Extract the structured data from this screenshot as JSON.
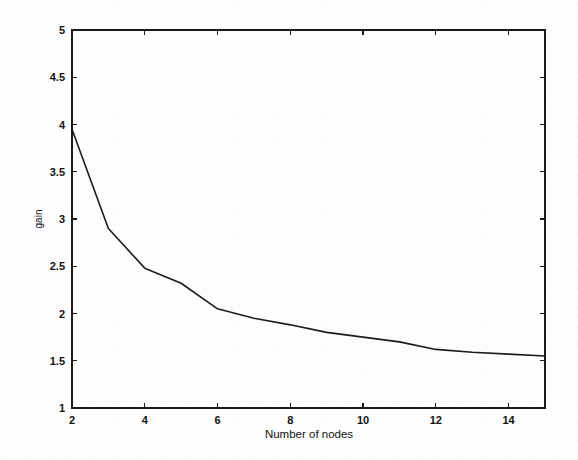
{
  "figure": {
    "width": 578,
    "height": 460,
    "background_color": "#fdfdfd",
    "line_color": "#1c1c1c",
    "axis_color": "#1a1a1a"
  },
  "chart_data": {
    "type": "line",
    "title": "",
    "xlabel": "Number of nodes",
    "ylabel": "gain",
    "xlim": [
      2,
      15
    ],
    "ylim": [
      1,
      5
    ],
    "grid": false,
    "legend": null,
    "xticks": [
      2,
      4,
      6,
      8,
      10,
      12,
      14
    ],
    "xtick_labels": [
      "2",
      "4",
      "6",
      "8",
      "10",
      "12",
      "14"
    ],
    "yticks": [
      1,
      1.5,
      2,
      2.5,
      3,
      3.5,
      4,
      4.5,
      5
    ],
    "ytick_labels": [
      "1",
      "1.5",
      "2",
      "2.5",
      "3",
      "3.5",
      "4",
      "4.5",
      "5"
    ],
    "x": [
      2,
      3,
      4,
      5,
      6,
      7,
      8,
      9,
      10,
      11,
      12,
      13,
      14,
      15
    ],
    "values": [
      3.95,
      2.9,
      2.48,
      2.32,
      2.05,
      1.95,
      1.88,
      1.8,
      1.75,
      1.7,
      1.62,
      1.59,
      1.57,
      1.55
    ],
    "series": [
      {
        "name": "gain",
        "values": [
          3.95,
          2.9,
          2.48,
          2.32,
          2.05,
          1.95,
          1.88,
          1.8,
          1.75,
          1.7,
          1.62,
          1.59,
          1.57,
          1.55
        ]
      }
    ]
  },
  "plot_box": {
    "left": 72,
    "right": 545,
    "top": 30,
    "bottom": 408
  }
}
